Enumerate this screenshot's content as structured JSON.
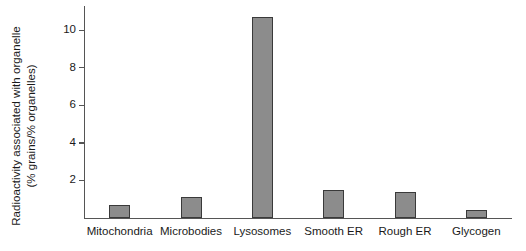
{
  "chart_data": {
    "type": "bar",
    "title": "",
    "xlabel": "",
    "ylabel": "Radioactivity associated with organelle (% grains/% organelles)",
    "ylabel_line1": "Radioactivity associated with organelle",
    "ylabel_line2": "(% grains/% organelles)",
    "categories": [
      "Mitochondria",
      "Microbodies",
      "Lysosomes",
      "Smooth ER",
      "Rough ER",
      "Glycogen"
    ],
    "values": [
      0.7,
      1.1,
      10.7,
      1.5,
      1.4,
      0.45
    ],
    "ylim": [
      0,
      11.3
    ],
    "yticks": [
      2,
      4,
      6,
      8,
      10
    ],
    "ytick_labels": [
      "2",
      "4",
      "6",
      "8",
      "10"
    ],
    "grid": false,
    "legend": null,
    "bar_color": "#8c8c8c",
    "bar_edge_color": "#3a3a3a",
    "axis_color": "#555555",
    "background_color": "#ffffff"
  }
}
